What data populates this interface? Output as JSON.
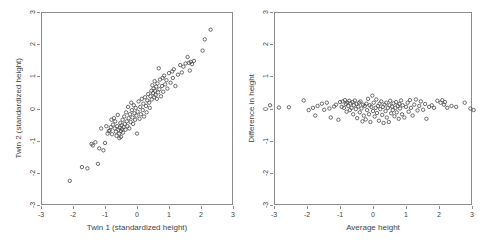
{
  "figure": {
    "background": "#ffffff",
    "marker_color": "#4a4a4a",
    "frame_color": "#8c8c8c"
  },
  "chart_data": [
    {
      "type": "scatter",
      "title": "",
      "xlabel": "Twin 1 (standardized height)",
      "ylabel": "Twin 2 (standardized height)",
      "xlim": [
        -3,
        3
      ],
      "ylim": [
        -3,
        3
      ],
      "xticks": [
        -3,
        -2,
        -1,
        0,
        1,
        2,
        3
      ],
      "yticks": [
        -3,
        -2,
        -1,
        0,
        1,
        2,
        3
      ],
      "xticklabels": [
        "-3",
        "-2",
        "-1",
        "0",
        "1",
        "2",
        "3"
      ],
      "yticklabels": [
        "-3",
        "-2",
        "-1",
        "0",
        "1",
        "2",
        "3"
      ],
      "grid": false,
      "legend": "none",
      "marker": "open-circle",
      "n_points": 120,
      "points": [
        [
          -2.1,
          -2.25
        ],
        [
          -1.72,
          -1.82
        ],
        [
          -1.55,
          -1.86
        ],
        [
          -1.42,
          -1.1
        ],
        [
          -1.38,
          -1.15
        ],
        [
          -1.3,
          -1.05
        ],
        [
          -1.22,
          -1.72
        ],
        [
          -1.18,
          -1.24
        ],
        [
          -1.12,
          -0.62
        ],
        [
          -1.05,
          -1.3
        ],
        [
          -1.0,
          -1.07
        ],
        [
          -0.96,
          -0.55
        ],
        [
          -0.92,
          -0.78
        ],
        [
          -0.88,
          -0.7
        ],
        [
          -0.85,
          -0.68
        ],
        [
          -0.82,
          -0.58
        ],
        [
          -0.8,
          -0.35
        ],
        [
          -0.78,
          -0.8
        ],
        [
          -0.75,
          -0.5
        ],
        [
          -0.72,
          -0.3
        ],
        [
          -0.7,
          -0.62
        ],
        [
          -0.68,
          -0.4
        ],
        [
          -0.66,
          -0.72
        ],
        [
          -0.64,
          -0.85
        ],
        [
          -0.62,
          -0.55
        ],
        [
          -0.6,
          -0.2
        ],
        [
          -0.58,
          -0.66
        ],
        [
          -0.56,
          -0.78
        ],
        [
          -0.55,
          -0.92
        ],
        [
          -0.54,
          -0.6
        ],
        [
          -0.52,
          -0.45
        ],
        [
          -0.5,
          -0.7
        ],
        [
          -0.5,
          -0.88
        ],
        [
          -0.48,
          -0.52
        ],
        [
          -0.47,
          -0.64
        ],
        [
          -0.45,
          -0.35
        ],
        [
          -0.44,
          -0.75
        ],
        [
          -0.42,
          -0.58
        ],
        [
          -0.4,
          -0.25
        ],
        [
          -0.38,
          -0.48
        ],
        [
          -0.36,
          -0.66
        ],
        [
          -0.34,
          -0.12
        ],
        [
          -0.32,
          -0.4
        ],
        [
          -0.3,
          -0.55
        ],
        [
          -0.28,
          0.05
        ],
        [
          -0.26,
          -0.3
        ],
        [
          -0.24,
          -0.62
        ],
        [
          -0.22,
          -0.18
        ],
        [
          -0.2,
          -0.42
        ],
        [
          -0.18,
          0.18
        ],
        [
          -0.16,
          -0.05
        ],
        [
          -0.14,
          -0.28
        ],
        [
          -0.12,
          -0.48
        ],
        [
          -0.1,
          0.1
        ],
        [
          -0.08,
          -0.15
        ],
        [
          -0.06,
          -0.35
        ],
        [
          -0.04,
          0.02
        ],
        [
          -0.02,
          -0.22
        ],
        [
          0.0,
          -0.78
        ],
        [
          0.02,
          -0.1
        ],
        [
          0.05,
          0.22
        ],
        [
          0.08,
          -0.32
        ],
        [
          0.1,
          0.05
        ],
        [
          0.12,
          -0.18
        ],
        [
          0.15,
          0.3
        ],
        [
          0.18,
          -0.05
        ],
        [
          0.2,
          0.15
        ],
        [
          0.22,
          -0.25
        ],
        [
          0.25,
          0.35
        ],
        [
          0.28,
          0.08
        ],
        [
          0.3,
          -0.12
        ],
        [
          0.32,
          0.25
        ],
        [
          0.35,
          0.45
        ],
        [
          0.38,
          0.18
        ],
        [
          0.4,
          0.02
        ],
        [
          0.42,
          0.38
        ],
        [
          0.45,
          0.55
        ],
        [
          0.46,
          0.28
        ],
        [
          0.48,
          0.72
        ],
        [
          0.5,
          0.48
        ],
        [
          0.52,
          0.62
        ],
        [
          0.54,
          0.35
        ],
        [
          0.55,
          0.85
        ],
        [
          0.56,
          0.55
        ],
        [
          0.58,
          0.42
        ],
        [
          0.6,
          0.68
        ],
        [
          0.62,
          0.3
        ],
        [
          0.64,
          0.78
        ],
        [
          0.66,
          0.5
        ],
        [
          0.68,
          1.25
        ],
        [
          0.7,
          0.6
        ],
        [
          0.72,
          0.9
        ],
        [
          0.75,
          0.38
        ],
        [
          0.78,
          0.7
        ],
        [
          0.8,
          0.95
        ],
        [
          0.82,
          0.52
        ],
        [
          0.85,
          1.02
        ],
        [
          0.88,
          0.75
        ],
        [
          0.92,
          0.88
        ],
        [
          0.95,
          0.62
        ],
        [
          1.0,
          1.1
        ],
        [
          1.05,
          0.8
        ],
        [
          1.1,
          1.15
        ],
        [
          1.12,
          0.95
        ],
        [
          1.15,
          1.22
        ],
        [
          1.2,
          0.7
        ],
        [
          1.28,
          1.05
        ],
        [
          1.35,
          1.35
        ],
        [
          1.4,
          1.12
        ],
        [
          1.45,
          1.3
        ],
        [
          1.52,
          1.4
        ],
        [
          1.58,
          1.6
        ],
        [
          1.62,
          1.42
        ],
        [
          1.65,
          1.18
        ],
        [
          1.68,
          1.45
        ],
        [
          1.72,
          1.38
        ],
        [
          1.78,
          1.48
        ],
        [
          2.05,
          1.8
        ],
        [
          2.12,
          2.15
        ],
        [
          2.3,
          2.45
        ]
      ]
    },
    {
      "type": "scatter",
      "title": "",
      "xlabel": "Average height",
      "ylabel": "Difference in height",
      "xlim": [
        -3,
        3
      ],
      "ylim": [
        -3,
        3
      ],
      "xticks": [
        -3,
        -2,
        -1,
        0,
        1,
        2,
        3
      ],
      "yticks": [
        -3,
        -2,
        -1,
        0,
        1,
        2,
        3
      ],
      "xticklabels": [
        "-3",
        "-2",
        "-1",
        "0",
        "1",
        "2",
        "3"
      ],
      "yticklabels": [
        "-3",
        "-2",
        "-1",
        "0",
        "1",
        "2",
        "3"
      ],
      "grid": false,
      "legend": "none",
      "marker": "open-circle",
      "n_points": 120,
      "points": [
        [
          -3.12,
          0.1
        ],
        [
          -2.85,
          0.03
        ],
        [
          -2.55,
          0.04
        ],
        [
          -2.1,
          0.25
        ],
        [
          -1.95,
          -0.05
        ],
        [
          -1.82,
          0.02
        ],
        [
          -1.75,
          -0.22
        ],
        [
          -1.68,
          0.08
        ],
        [
          -1.55,
          0.15
        ],
        [
          -1.48,
          -0.04
        ],
        [
          -1.4,
          0.18
        ],
        [
          -1.32,
          0.0
        ],
        [
          -1.28,
          -0.28
        ],
        [
          -1.18,
          0.06
        ],
        [
          -1.12,
          0.12
        ],
        [
          -1.05,
          -0.35
        ],
        [
          -1.0,
          0.2
        ],
        [
          -0.95,
          0.05
        ],
        [
          -0.92,
          0.22
        ],
        [
          -0.88,
          0.02
        ],
        [
          -0.85,
          0.26
        ],
        [
          -0.82,
          0.14
        ],
        [
          -0.8,
          -0.1
        ],
        [
          -0.78,
          0.18
        ],
        [
          -0.75,
          0.08
        ],
        [
          -0.72,
          0.24
        ],
        [
          -0.7,
          -0.05
        ],
        [
          -0.68,
          0.16
        ],
        [
          -0.65,
          0.02
        ],
        [
          -0.62,
          0.2
        ],
        [
          -0.6,
          -0.18
        ],
        [
          -0.58,
          0.1
        ],
        [
          -0.55,
          0.25
        ],
        [
          -0.52,
          -0.02
        ],
        [
          -0.5,
          0.14
        ],
        [
          -0.48,
          -0.3
        ],
        [
          -0.45,
          0.06
        ],
        [
          -0.42,
          0.18
        ],
        [
          -0.4,
          -0.12
        ],
        [
          -0.38,
          0.22
        ],
        [
          -0.35,
          0.0
        ],
        [
          -0.32,
          -0.4
        ],
        [
          -0.3,
          0.12
        ],
        [
          -0.28,
          -0.22
        ],
        [
          -0.25,
          0.08
        ],
        [
          -0.22,
          -0.34
        ],
        [
          -0.2,
          0.15
        ],
        [
          -0.18,
          -0.05
        ],
        [
          -0.15,
          0.3
        ],
        [
          -0.12,
          -0.18
        ],
        [
          -0.1,
          0.1
        ],
        [
          -0.08,
          -0.42
        ],
        [
          -0.05,
          0.05
        ],
        [
          -0.02,
          0.4
        ],
        [
          0.0,
          -0.08
        ],
        [
          0.02,
          0.18
        ],
        [
          0.05,
          -0.25
        ],
        [
          0.08,
          0.02
        ],
        [
          0.1,
          0.28
        ],
        [
          0.12,
          -0.14
        ],
        [
          0.15,
          0.08
        ],
        [
          0.18,
          -0.38
        ],
        [
          0.2,
          0.15
        ],
        [
          0.22,
          -0.02
        ],
        [
          0.25,
          0.22
        ],
        [
          0.28,
          -0.2
        ],
        [
          0.3,
          0.05
        ],
        [
          0.32,
          -0.45
        ],
        [
          0.35,
          0.12
        ],
        [
          0.38,
          -0.08
        ],
        [
          0.4,
          0.18
        ],
        [
          0.42,
          -0.28
        ],
        [
          0.45,
          0.02
        ],
        [
          0.48,
          -0.42
        ],
        [
          0.5,
          0.1
        ],
        [
          0.52,
          0.24
        ],
        [
          0.55,
          -0.15
        ],
        [
          0.58,
          0.06
        ],
        [
          0.6,
          -0.05
        ],
        [
          0.62,
          0.16
        ],
        [
          0.65,
          -0.24
        ],
        [
          0.68,
          0.02
        ],
        [
          0.7,
          0.2
        ],
        [
          0.72,
          -0.12
        ],
        [
          0.75,
          0.08
        ],
        [
          0.78,
          -0.32
        ],
        [
          0.8,
          0.14
        ],
        [
          0.82,
          0.0
        ],
        [
          0.85,
          0.25
        ],
        [
          0.88,
          -0.18
        ],
        [
          0.9,
          0.1
        ],
        [
          0.95,
          -0.28
        ],
        [
          1.0,
          0.05
        ],
        [
          1.05,
          0.18
        ],
        [
          1.08,
          -0.1
        ],
        [
          1.12,
          0.26
        ],
        [
          1.15,
          0.02
        ],
        [
          1.2,
          -0.22
        ],
        [
          1.25,
          0.12
        ],
        [
          1.3,
          0.28
        ],
        [
          1.35,
          -0.06
        ],
        [
          1.4,
          0.08
        ],
        [
          1.45,
          0.22
        ],
        [
          1.52,
          -0.04
        ],
        [
          1.58,
          0.14
        ],
        [
          1.62,
          -0.32
        ],
        [
          1.7,
          0.05
        ],
        [
          1.78,
          0.1
        ],
        [
          1.85,
          0.02
        ],
        [
          1.95,
          0.24
        ],
        [
          2.05,
          0.18
        ],
        [
          2.1,
          0.26
        ],
        [
          2.15,
          0.12
        ],
        [
          2.18,
          0.2
        ],
        [
          2.25,
          0.02
        ],
        [
          2.38,
          0.08
        ],
        [
          2.52,
          0.05
        ],
        [
          2.78,
          0.18
        ],
        [
          2.95,
          0.0
        ],
        [
          3.05,
          -0.05
        ]
      ]
    }
  ]
}
